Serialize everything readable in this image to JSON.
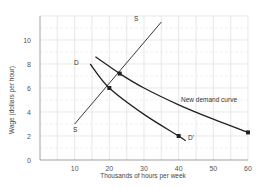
{
  "chart_data": {
    "type": "line",
    "title": "",
    "xlabel": "Thousands of hours per week",
    "ylabel": "Wage (dollars per hour)",
    "xlim": [
      0,
      60
    ],
    "ylim": [
      0,
      12
    ],
    "grid": true,
    "x_ticks": [
      10,
      20,
      30,
      40,
      50,
      60
    ],
    "y_ticks": [
      0,
      2,
      4,
      6,
      8,
      10
    ],
    "series": [
      {
        "name": "S",
        "kind": "supply",
        "start_label": "S",
        "end_label": "S",
        "points": [
          [
            10,
            3
          ],
          [
            35,
            11.5
          ]
        ]
      },
      {
        "name": "D",
        "kind": "demand",
        "start_label": "D",
        "end_label": "D'",
        "points": [
          [
            14.5,
            8
          ],
          [
            20,
            6
          ],
          [
            30,
            3.8
          ],
          [
            40,
            2
          ],
          [
            42,
            1.6
          ]
        ]
      },
      {
        "name": "New demand curve",
        "kind": "demand",
        "label": "New demand curve",
        "points": [
          [
            16,
            8.6
          ],
          [
            23,
            7.2
          ],
          [
            30,
            6
          ],
          [
            40,
            4.6
          ],
          [
            50,
            3.4
          ],
          [
            60,
            2.3
          ]
        ]
      }
    ],
    "markers": [
      {
        "x": 20,
        "y": 6,
        "note": "equilibrium D and S"
      },
      {
        "x": 23,
        "y": 7.2,
        "note": "equilibrium new demand and S"
      },
      {
        "x": 40,
        "y": 2,
        "note": "point on D"
      },
      {
        "x": 60,
        "y": 2.3,
        "note": "end of new demand curve"
      }
    ],
    "legend": null
  },
  "labels": {
    "xlabel": "Thousands of hours per week",
    "ylabel": "Wage (dollars per hour)",
    "s_top": "S",
    "s_bottom": "S",
    "d_start": "D",
    "d_end": "D'",
    "new_demand": "New demand curve"
  },
  "ticks": {
    "x": [
      "10",
      "20",
      "30",
      "40",
      "50",
      "60"
    ],
    "y": [
      "0",
      "2",
      "4",
      "6",
      "8",
      "10"
    ]
  },
  "colors": {
    "grid": "#d9d9d9",
    "axis": "#888888",
    "line": "#222222"
  }
}
